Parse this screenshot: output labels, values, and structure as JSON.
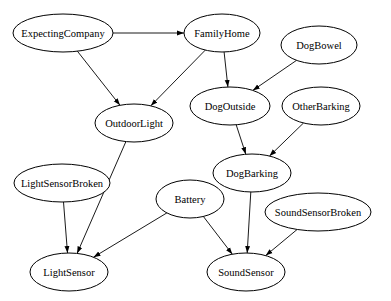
{
  "diagram": {
    "type": "directed-graph",
    "nodes": [
      {
        "id": "ExpectingCompany",
        "label": "ExpectingCompany",
        "cx": 63,
        "cy": 33,
        "rx": 50,
        "ry": 19
      },
      {
        "id": "FamilyHome",
        "label": "FamilyHome",
        "cx": 222,
        "cy": 33,
        "rx": 38,
        "ry": 19
      },
      {
        "id": "DogBowel",
        "label": "DogBowel",
        "cx": 319,
        "cy": 45,
        "rx": 38,
        "ry": 19
      },
      {
        "id": "OutdoorLight",
        "label": "OutdoorLight",
        "cx": 134,
        "cy": 123,
        "rx": 39,
        "ry": 19
      },
      {
        "id": "DogOutside",
        "label": "DogOutside",
        "cx": 230,
        "cy": 106,
        "rx": 40,
        "ry": 19
      },
      {
        "id": "OtherBarking",
        "label": "OtherBarking",
        "cx": 321,
        "cy": 106,
        "rx": 39,
        "ry": 19
      },
      {
        "id": "DogBarking",
        "label": "DogBarking",
        "cx": 252,
        "cy": 173,
        "rx": 39,
        "ry": 19
      },
      {
        "id": "LightSensorBroken",
        "label": "LightSensorBroken",
        "cx": 62,
        "cy": 183,
        "rx": 48,
        "ry": 19
      },
      {
        "id": "Battery",
        "label": "Battery",
        "cx": 190,
        "cy": 199,
        "rx": 34,
        "ry": 19
      },
      {
        "id": "SoundSensorBroken",
        "label": "SoundSensorBroken",
        "cx": 318,
        "cy": 212,
        "rx": 53,
        "ry": 19
      },
      {
        "id": "LightSensor",
        "label": "LightSensor",
        "cx": 69,
        "cy": 272,
        "rx": 39,
        "ry": 19
      },
      {
        "id": "SoundSensor",
        "label": "SoundSensor",
        "cx": 246,
        "cy": 272,
        "rx": 39,
        "ry": 19
      }
    ],
    "edges": [
      {
        "from": "ExpectingCompany",
        "to": "FamilyHome"
      },
      {
        "from": "ExpectingCompany",
        "to": "OutdoorLight"
      },
      {
        "from": "FamilyHome",
        "to": "OutdoorLight"
      },
      {
        "from": "FamilyHome",
        "to": "DogOutside"
      },
      {
        "from": "DogBowel",
        "to": "DogOutside"
      },
      {
        "from": "DogOutside",
        "to": "DogBarking"
      },
      {
        "from": "OtherBarking",
        "to": "DogBarking"
      },
      {
        "from": "OutdoorLight",
        "to": "LightSensor"
      },
      {
        "from": "LightSensorBroken",
        "to": "LightSensor"
      },
      {
        "from": "Battery",
        "to": "LightSensor"
      },
      {
        "from": "Battery",
        "to": "SoundSensor"
      },
      {
        "from": "DogBarking",
        "to": "SoundSensor"
      },
      {
        "from": "SoundSensorBroken",
        "to": "SoundSensor"
      }
    ],
    "colors": {
      "stroke": "#000000",
      "fill": "#ffffff",
      "background": "#ffffff"
    }
  }
}
